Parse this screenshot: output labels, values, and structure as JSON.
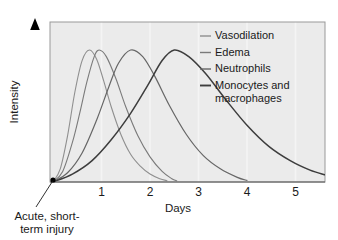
{
  "chart_data": {
    "type": "line",
    "title": "",
    "xlabel": "Days",
    "ylabel": "Intensity",
    "xlim": [
      0,
      5.6
    ],
    "ylim": [
      0,
      1.08
    ],
    "grid": true,
    "legend_position": "top-right",
    "xticks": [
      "1",
      "2",
      "3",
      "4",
      "5"
    ],
    "xtick_values": [
      1,
      2,
      3,
      4,
      5
    ],
    "yticks": [],
    "annotations": [
      {
        "name": "origin-annotation",
        "text_line1": "Acute, short-",
        "text_line2": "term injury",
        "points_to_x": 0,
        "points_to_y": 0
      }
    ],
    "series": [
      {
        "name": "Vasodilation",
        "color": "#8f8f8f",
        "width": 1.1,
        "peak_x": 0.75,
        "peak_y": 1.0,
        "rise": 0.3,
        "decay": 0.42,
        "end_x": 2.35,
        "x": [
          0,
          0.15,
          0.3,
          0.45,
          0.6,
          0.75,
          0.9,
          1.05,
          1.2,
          1.4,
          1.6,
          1.8,
          2.0,
          2.2,
          2.35
        ],
        "y": [
          0,
          0.1,
          0.35,
          0.68,
          0.92,
          1.0,
          0.93,
          0.76,
          0.57,
          0.36,
          0.21,
          0.12,
          0.06,
          0.025,
          0.01
        ]
      },
      {
        "name": "Edema",
        "color": "#7a7a7a",
        "width": 1.1,
        "peak_x": 0.95,
        "peak_y": 1.0,
        "rise": 0.33,
        "decay": 0.5,
        "end_x": 2.55,
        "x": [
          0,
          0.2,
          0.4,
          0.55,
          0.7,
          0.85,
          0.95,
          1.1,
          1.3,
          1.5,
          1.75,
          2.0,
          2.25,
          2.45,
          2.55
        ],
        "y": [
          0,
          0.08,
          0.3,
          0.52,
          0.76,
          0.95,
          1.0,
          0.95,
          0.78,
          0.57,
          0.35,
          0.19,
          0.08,
          0.025,
          0.01
        ]
      },
      {
        "name": "Neutrophils",
        "color": "#666666",
        "width": 1.2,
        "peak_x": 1.6,
        "peak_y": 1.0,
        "rise": 0.5,
        "decay": 0.75,
        "end_x": 4.0,
        "x": [
          0,
          0.3,
          0.6,
          0.9,
          1.15,
          1.35,
          1.6,
          1.85,
          2.1,
          2.4,
          2.75,
          3.1,
          3.45,
          3.8,
          4.0
        ],
        "y": [
          0,
          0.07,
          0.22,
          0.47,
          0.72,
          0.9,
          1.0,
          0.95,
          0.8,
          0.58,
          0.36,
          0.2,
          0.1,
          0.035,
          0.012
        ]
      },
      {
        "name": "Monocytes and macrophages",
        "color": "#3d3d3d",
        "width": 1.5,
        "peak_x": 2.5,
        "peak_y": 1.0,
        "rise": 0.85,
        "decay": 1.15,
        "end_x": 5.6,
        "x": [
          0,
          0.4,
          0.8,
          1.2,
          1.6,
          1.95,
          2.25,
          2.5,
          2.8,
          3.15,
          3.55,
          4.0,
          4.45,
          4.9,
          5.3,
          5.6
        ],
        "y": [
          0,
          0.06,
          0.16,
          0.32,
          0.52,
          0.73,
          0.92,
          1.0,
          0.95,
          0.82,
          0.63,
          0.43,
          0.27,
          0.16,
          0.09,
          0.055
        ]
      }
    ],
    "legend_entries": [
      {
        "label": "Vasodilation",
        "color": "#8f8f8f"
      },
      {
        "label": "Edema",
        "color": "#7a7a7a"
      },
      {
        "label": "Neutrophils",
        "color": "#666666"
      },
      {
        "label": "Monocytes and",
        "label2": "macrophages",
        "color": "#3d3d3d"
      }
    ],
    "style": {
      "plot_background": "#ebebeb",
      "plot_border": "#999999",
      "gridline_color": "#f4f4f4",
      "axis_arrow_color": "#000000",
      "text_color": "#1a1a1a"
    }
  }
}
